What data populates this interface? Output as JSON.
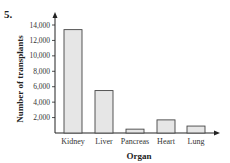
{
  "problem_number": "5.",
  "chart_data": {
    "type": "bar",
    "title": "",
    "xlabel": "Organ",
    "ylabel": "Number of transplants",
    "categories": [
      "Kidney",
      "Liver",
      "Pancreas",
      "Heart",
      "Lung"
    ],
    "values": [
      13400,
      5500,
      500,
      1700,
      900
    ],
    "yticks": [
      "2,000",
      "4,000",
      "6,000",
      "8,000",
      "10,000",
      "12,000",
      "14,000"
    ],
    "ylim": [
      0,
      14800
    ],
    "grid": false,
    "legend": "none",
    "bar_fill": "#e6e6e6",
    "bar_stroke": "#444444"
  }
}
